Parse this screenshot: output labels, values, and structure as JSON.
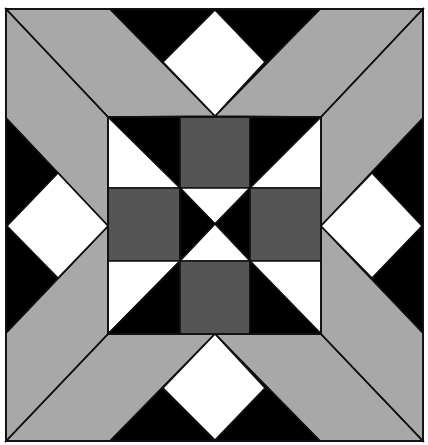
{
  "diagram": {
    "type": "quilt-block",
    "colors": {
      "background": "#ffffff",
      "light_gray": "#a8a8a8",
      "dark_gray": "#555555",
      "black": "#000000",
      "white": "#ffffff",
      "outline": "#111111"
    },
    "outer_square": {
      "x": 6,
      "y": 9,
      "w": 417,
      "h": 432
    },
    "inner_square": {
      "x": 108,
      "y": 117,
      "w": 213,
      "h": 217
    },
    "grid": {
      "xs": [
        108,
        180,
        250,
        321
      ],
      "ys": [
        117,
        188,
        261,
        334
      ]
    },
    "polygons": [
      {
        "name": "band-top-left-upper",
        "fill": "light_gray",
        "points": "6,9 110,9 215,116 108,117"
      },
      {
        "name": "band-top-left-lower",
        "fill": "light_gray",
        "points": "6,9 108,117 108,226 6,118"
      },
      {
        "name": "band-top-right-upper",
        "fill": "light_gray",
        "points": "423,9 320,9 215,116 321,117"
      },
      {
        "name": "band-top-right-lower",
        "fill": "light_gray",
        "points": "423,9 321,117 321,226 423,118"
      },
      {
        "name": "band-bottom-left-lower",
        "fill": "light_gray",
        "points": "6,441 110,441 215,334 108,334"
      },
      {
        "name": "band-bottom-left-upper",
        "fill": "light_gray",
        "points": "6,441 108,334 108,226 6,333"
      },
      {
        "name": "band-bottom-right-lower",
        "fill": "light_gray",
        "points": "423,441 320,441 215,334 321,334"
      },
      {
        "name": "band-bottom-right-upper",
        "fill": "light_gray",
        "points": "423,441 321,334 321,226 423,333"
      },
      {
        "name": "triangle-top",
        "fill": "black",
        "points": "110,9 320,9 215,116"
      },
      {
        "name": "diamond-top",
        "fill": "white",
        "points": "215,10 265,62 215,116 163,62"
      },
      {
        "name": "triangle-bottom",
        "fill": "black",
        "points": "110,441 320,441 215,334"
      },
      {
        "name": "diamond-bottom",
        "fill": "white",
        "points": "215,334 265,388 215,440 163,388"
      },
      {
        "name": "triangle-left",
        "fill": "black",
        "points": "6,118 6,333 108,226"
      },
      {
        "name": "diamond-left",
        "fill": "white",
        "points": "7,226 58,173 108,226 58,278"
      },
      {
        "name": "triangle-right",
        "fill": "black",
        "points": "423,118 423,333 321,226"
      },
      {
        "name": "diamond-right",
        "fill": "white",
        "points": "422,226 372,173 321,226 372,278"
      },
      {
        "name": "cell-tl-black",
        "fill": "black",
        "points": "108,117 180,117 180,188"
      },
      {
        "name": "cell-tl-white",
        "fill": "white",
        "points": "108,117 180,188 108,188"
      },
      {
        "name": "cell-tc-dark",
        "fill": "dark_gray",
        "points": "180,117 250,117 250,188 180,188"
      },
      {
        "name": "cell-tr-black",
        "fill": "black",
        "points": "250,117 321,117 250,188"
      },
      {
        "name": "cell-tr-white",
        "fill": "white",
        "points": "321,117 321,188 250,188"
      },
      {
        "name": "cell-ml-dark",
        "fill": "dark_gray",
        "points": "108,188 180,188 180,261 108,261"
      },
      {
        "name": "cell-c-top-white",
        "fill": "white",
        "points": "180,188 250,188 215,224"
      },
      {
        "name": "cell-c-left-black",
        "fill": "black",
        "points": "180,188 215,224 180,261"
      },
      {
        "name": "cell-c-right-black",
        "fill": "black",
        "points": "250,188 250,261 215,224"
      },
      {
        "name": "cell-c-bottom-white",
        "fill": "white",
        "points": "180,261 215,224 250,261"
      },
      {
        "name": "cell-mr-dark",
        "fill": "dark_gray",
        "points": "250,188 321,188 321,261 250,261"
      },
      {
        "name": "cell-bl-white",
        "fill": "white",
        "points": "108,261 180,261 108,334"
      },
      {
        "name": "cell-bl-black",
        "fill": "black",
        "points": "180,261 180,334 108,334"
      },
      {
        "name": "cell-bc-dark",
        "fill": "dark_gray",
        "points": "180,261 250,261 250,334 180,334"
      },
      {
        "name": "cell-br-white",
        "fill": "white",
        "points": "250,261 321,261 321,334"
      },
      {
        "name": "cell-br-black",
        "fill": "black",
        "points": "250,261 321,334 250,334"
      }
    ],
    "lines": [
      {
        "name": "diagonal-top-left",
        "x1": 6,
        "y1": 9,
        "x2": 108,
        "y2": 117
      },
      {
        "name": "diagonal-top-right",
        "x1": 423,
        "y1": 9,
        "x2": 321,
        "y2": 117
      },
      {
        "name": "diagonal-bottom-left",
        "x1": 6,
        "y1": 441,
        "x2": 108,
        "y2": 334
      },
      {
        "name": "diagonal-bottom-right",
        "x1": 423,
        "y1": 441,
        "x2": 321,
        "y2": 334
      }
    ]
  }
}
